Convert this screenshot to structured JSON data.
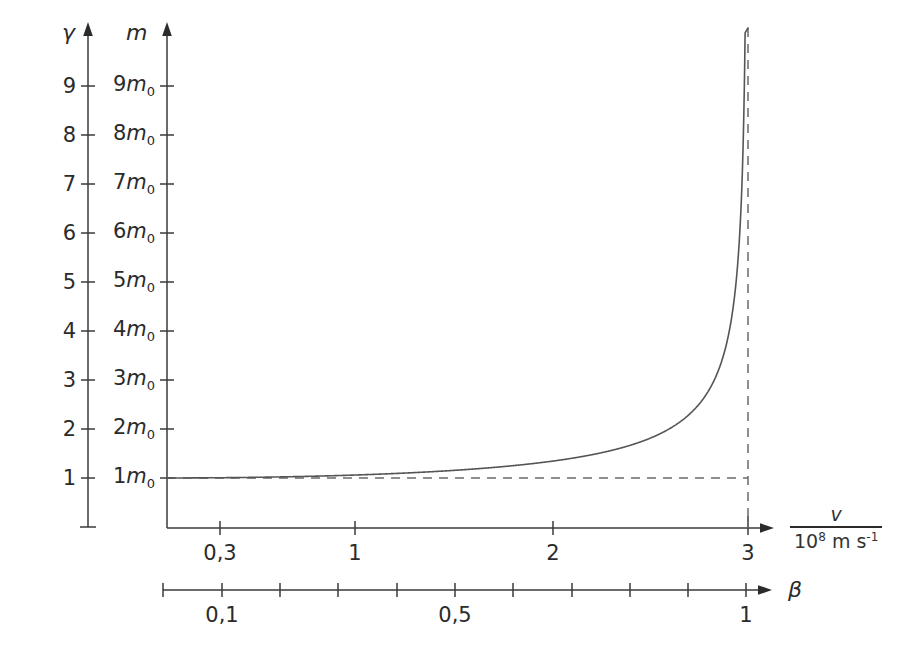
{
  "figure": {
    "background_color": "#ffffff",
    "line_color": "#555555",
    "axis_color": "#3a3a3a",
    "dash_color": "#6b6b6b"
  },
  "axes": {
    "gamma": {
      "symbol": "γ",
      "ticks": [
        "1",
        "2",
        "3",
        "4",
        "5",
        "6",
        "7",
        "8",
        "9"
      ]
    },
    "mass": {
      "symbol": "m",
      "unit_base": "m",
      "unit_sub": "0",
      "ticks": [
        {
          "coef": "1",
          "sym": "m",
          "sub": "0"
        },
        {
          "coef": "2",
          "sym": "m",
          "sub": "0"
        },
        {
          "coef": "3",
          "sym": "m",
          "sub": "0"
        },
        {
          "coef": "4",
          "sym": "m",
          "sub": "0"
        },
        {
          "coef": "5",
          "sym": "m",
          "sub": "0"
        },
        {
          "coef": "6",
          "sym": "m",
          "sub": "0"
        },
        {
          "coef": "7",
          "sym": "m",
          "sub": "0"
        },
        {
          "coef": "8",
          "sym": "m",
          "sub": "0"
        },
        {
          "coef": "9",
          "sym": "m",
          "sub": "0"
        }
      ]
    },
    "velocity": {
      "label_numerator": "v",
      "label_denominator_base": "10",
      "label_denominator_exp": "8",
      "label_denominator_unit": "m s",
      "label_denominator_unit_exp": "-1",
      "ticks": [
        "0,3",
        "1",
        "2",
        "3"
      ]
    },
    "beta": {
      "symbol": "β",
      "ticks": [
        "0,1",
        "0,5",
        "1"
      ]
    }
  },
  "chart_data": {
    "type": "line",
    "title": "",
    "xlabel": "v / 10^8 m s^-1",
    "ylabel": "m  (and γ)",
    "grid": false,
    "legend": "none",
    "xlim": [
      0.22,
      3.0
    ],
    "ylim": [
      0,
      9.8
    ],
    "x_ticks": [
      0.3,
      1,
      2,
      3
    ],
    "x_tick_labels": [
      "0,3",
      "1",
      "2",
      "3"
    ],
    "y_ticks": [
      1,
      2,
      3,
      4,
      5,
      6,
      7,
      8,
      9
    ],
    "y_tick_labels_gamma": [
      "1",
      "2",
      "3",
      "4",
      "5",
      "6",
      "7",
      "8",
      "9"
    ],
    "y_tick_labels_mass": [
      "1m0",
      "2m0",
      "3m0",
      "4m0",
      "5m0",
      "6m0",
      "7m0",
      "8m0",
      "9m0"
    ],
    "secondary_x_axis": {
      "name": "beta",
      "ticks": [
        0.1,
        0.2,
        0.3,
        0.4,
        0.5,
        0.6,
        0.7,
        0.8,
        0.9,
        1.0
      ],
      "labeled_ticks": [
        0.1,
        0.5,
        1.0
      ],
      "labeled_tick_text": [
        "0,1",
        "0,5",
        "1"
      ]
    },
    "asymptotes": [
      {
        "kind": "vertical",
        "x": 3.0,
        "style": "dashed",
        "meaning": "v = c"
      },
      {
        "kind": "horizontal",
        "y": 1.0,
        "style": "dashed",
        "meaning": "m = m0"
      }
    ],
    "series": [
      {
        "name": "m / m0 = 1 / sqrt(1 - (v/c)^2)",
        "x": [
          0.22,
          0.3,
          0.5,
          0.75,
          1.0,
          1.25,
          1.5,
          1.75,
          2.0,
          2.2,
          2.4,
          2.55,
          2.7,
          2.8,
          2.85,
          2.9,
          2.93,
          2.95,
          2.97,
          2.98,
          2.99
        ],
        "values": [
          1.003,
          1.005,
          1.014,
          1.032,
          1.06,
          1.096,
          1.147,
          1.218,
          1.342,
          1.48,
          1.715,
          2.0,
          2.442,
          3.044,
          3.54,
          4.385,
          5.228,
          6.061,
          8.264,
          10.03,
          13.76
        ]
      }
    ]
  }
}
